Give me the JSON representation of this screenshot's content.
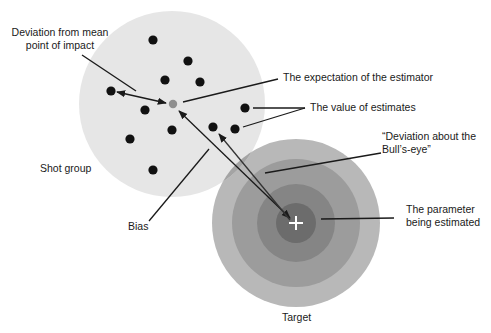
{
  "labels": {
    "deviation_mean_line1": "Deviation from mean",
    "deviation_mean_line2": "point of impact",
    "expectation": "The expectation of the estimator",
    "value_estimates": "The value of estimates",
    "bullseye_line1": "“Deviation about the",
    "bullseye_line2": "Bull’s-eye”",
    "parameter_line1": "The parameter",
    "parameter_line2": "being estimated",
    "shot_group": "Shot group",
    "bias": "Bias",
    "target": "Target"
  },
  "colors": {
    "shot_group_fill": "#e6e6e6",
    "overlap_fill": "#9a9a9a",
    "ring1": "#b8b8b8",
    "ring2": "#9c9c9c",
    "ring3": "#858585",
    "ring4": "#6c6c6c",
    "dot": "#111111",
    "mean_dot": "#8f8f8f",
    "line": "#1a1a1a"
  },
  "shot_group": {
    "cx": 172,
    "cy": 104,
    "r": 93
  },
  "target": {
    "cx": 296,
    "cy": 223,
    "radii": [
      84,
      64,
      39,
      20
    ]
  },
  "dots": [
    [
      153,
      40
    ],
    [
      188,
      61
    ],
    [
      165,
      80
    ],
    [
      200,
      82
    ],
    [
      111,
      91
    ],
    [
      145,
      110
    ],
    [
      245,
      108
    ],
    [
      172,
      130
    ],
    [
      213,
      127
    ],
    [
      235,
      129
    ],
    [
      130,
      139
    ],
    [
      153,
      170
    ]
  ],
  "mean_point": [
    173,
    104
  ]
}
